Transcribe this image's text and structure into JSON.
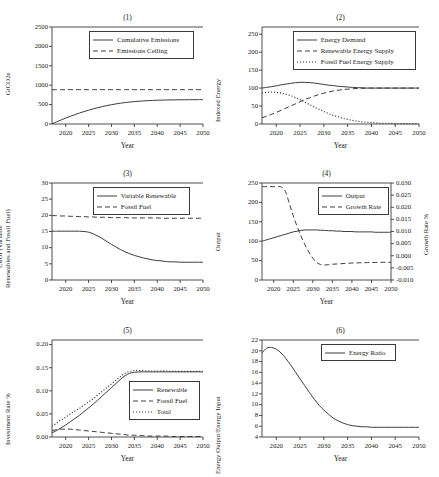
{
  "figure": {
    "background": "#ffffff",
    "line_color": "#333333",
    "axis_color": "#3a3a3a",
    "xlabel": "Year",
    "xticks": [
      "2020",
      "2025",
      "2030",
      "2035",
      "2040",
      "2045",
      "2050"
    ]
  },
  "chart_data": [
    {
      "id": "panel-1",
      "type": "line",
      "title": "(1)",
      "xlabel": "Year",
      "ylabel": "GtCO2e",
      "xlim": [
        2017,
        2050
      ],
      "ylim": [
        0,
        2500
      ],
      "yticks": [
        0,
        500,
        1000,
        1500,
        2000,
        2500
      ],
      "xticks": [
        2020,
        2025,
        2030,
        2035,
        2040,
        2045,
        2050
      ],
      "grid": false,
      "legend_position": "upper center",
      "x": [
        2017,
        2018,
        2019,
        2020,
        2021,
        2022,
        2023,
        2024,
        2025,
        2026,
        2027,
        2028,
        2029,
        2030,
        2031,
        2032,
        2033,
        2034,
        2035,
        2036,
        2037,
        2038,
        2039,
        2040,
        2041,
        2042,
        2043,
        2044,
        2045,
        2046,
        2047,
        2048,
        2049,
        2050
      ],
      "series": [
        {
          "name": "Cumulative Emissions",
          "style": "solid",
          "values": [
            5,
            55,
            105,
            153,
            198,
            241,
            282,
            320,
            356,
            390,
            421,
            449,
            475,
            498,
            519,
            537,
            552,
            566,
            577,
            587,
            595,
            602,
            608,
            612,
            616,
            619,
            621,
            623,
            624,
            625,
            626,
            627,
            627,
            628
          ]
        },
        {
          "name": "Emissions Ceiling",
          "style": "dashed",
          "values": [
            885,
            885,
            885,
            885,
            885,
            885,
            885,
            885,
            885,
            885,
            885,
            885,
            885,
            885,
            885,
            885,
            885,
            885,
            885,
            885,
            885,
            885,
            885,
            885,
            885,
            885,
            885,
            885,
            885,
            885,
            885,
            885,
            885,
            885
          ]
        }
      ]
    },
    {
      "id": "panel-2",
      "type": "line",
      "title": "(2)",
      "xlabel": "Year",
      "ylabel": "Indexed Energy",
      "xlim": [
        2017,
        2050
      ],
      "ylim": [
        0,
        270
      ],
      "yticks": [
        0,
        50,
        100,
        150,
        200,
        250
      ],
      "xticks": [
        2020,
        2025,
        2030,
        2035,
        2040,
        2045,
        2050
      ],
      "grid": false,
      "legend_position": "upper center",
      "x": [
        2017,
        2018,
        2019,
        2020,
        2021,
        2022,
        2023,
        2024,
        2025,
        2026,
        2027,
        2028,
        2029,
        2030,
        2031,
        2032,
        2033,
        2034,
        2035,
        2036,
        2037,
        2038,
        2039,
        2040,
        2041,
        2042,
        2043,
        2044,
        2045,
        2046,
        2047,
        2048,
        2049,
        2050
      ],
      "series": [
        {
          "name": "Energy Demand",
          "style": "solid",
          "values": [
            100,
            102,
            104,
            106,
            109,
            111,
            113,
            115,
            116,
            116,
            115,
            114,
            112,
            110,
            108,
            107,
            105,
            104,
            103,
            102,
            101,
            101,
            100,
            100,
            100,
            100,
            100,
            100,
            100,
            100,
            100,
            100,
            100,
            100
          ]
        },
        {
          "name": "Renewable Energy Supply",
          "style": "dashed",
          "values": [
            17,
            22,
            27,
            32,
            38,
            44,
            50,
            56,
            62,
            68,
            73,
            78,
            82,
            86,
            89,
            92,
            94,
            96,
            97,
            98,
            99,
            99,
            100,
            100,
            100,
            100,
            100,
            100,
            100,
            100,
            100,
            100,
            100,
            100
          ]
        },
        {
          "name": "Fossil Fuel Energy Supply",
          "style": "dotted",
          "values": [
            86,
            88,
            89,
            88,
            86,
            83,
            79,
            74,
            68,
            61,
            54,
            47,
            41,
            35,
            29,
            24,
            20,
            16,
            13,
            10,
            8,
            6,
            5,
            4,
            3,
            2,
            2,
            2,
            1,
            1,
            1,
            1,
            1,
            1
          ]
        }
      ]
    },
    {
      "id": "panel-3",
      "type": "line",
      "title": "(3)",
      "xlabel": "Year",
      "ylabel": "EROI (Variable Renewables and Fossil Fuel)",
      "ylabel_lines": [
        "EROI (Variable",
        "Renewables and Fossil Fuel)"
      ],
      "xlim": [
        2017,
        2050
      ],
      "ylim": [
        0,
        30
      ],
      "yticks": [
        0,
        5,
        10,
        15,
        20,
        25,
        30
      ],
      "xticks": [
        2020,
        2025,
        2030,
        2035,
        2040,
        2045,
        2050
      ],
      "grid": false,
      "legend_position": "upper center",
      "x": [
        2017,
        2018,
        2019,
        2020,
        2021,
        2022,
        2023,
        2024,
        2025,
        2026,
        2027,
        2028,
        2029,
        2030,
        2031,
        2032,
        2033,
        2034,
        2035,
        2036,
        2037,
        2038,
        2039,
        2040,
        2041,
        2042,
        2043,
        2044,
        2045,
        2046,
        2047,
        2048,
        2049,
        2050
      ],
      "series": [
        {
          "name": "Variable Renewable",
          "style": "solid",
          "values": [
            15.1,
            15.1,
            15.1,
            15.1,
            15.1,
            15.1,
            15.1,
            15.0,
            14.8,
            14.3,
            13.6,
            12.8,
            11.9,
            11.0,
            10.2,
            9.4,
            8.7,
            8.1,
            7.6,
            7.2,
            6.8,
            6.5,
            6.2,
            6.0,
            5.9,
            5.7,
            5.6,
            5.6,
            5.5,
            5.5,
            5.5,
            5.5,
            5.5,
            5.5
          ]
        },
        {
          "name": "Fossil Fuel",
          "style": "dashed",
          "values": [
            19.9,
            19.9,
            19.8,
            19.8,
            19.7,
            19.7,
            19.6,
            19.6,
            19.5,
            19.5,
            19.4,
            19.4,
            19.4,
            19.3,
            19.3,
            19.3,
            19.3,
            19.2,
            19.2,
            19.2,
            19.2,
            19.2,
            19.2,
            19.2,
            19.1,
            19.1,
            19.1,
            19.1,
            19.1,
            19.1,
            19.1,
            19.1,
            19.1,
            19.1
          ]
        }
      ]
    },
    {
      "id": "panel-4",
      "type": "line",
      "title": "(4)",
      "xlabel": "Year",
      "ylabel": "Output",
      "ylabel_right": "Growth Rate %",
      "xlim": [
        2017,
        2050
      ],
      "ylim": [
        0,
        250
      ],
      "yticks": [
        0,
        50,
        100,
        150,
        200,
        250
      ],
      "ylim_right": [
        -0.01,
        0.03
      ],
      "yticks_right": [
        "0.030",
        "0.025",
        "0.020",
        "0.015",
        "0.010",
        "0.005",
        "0.000",
        "-0.005",
        "-0.010"
      ],
      "xticks": [
        2020,
        2025,
        2030,
        2035,
        2040,
        2045,
        2050
      ],
      "grid": false,
      "legend_position": "upper center",
      "x": [
        2017,
        2018,
        2019,
        2020,
        2021,
        2022,
        2023,
        2024,
        2025,
        2026,
        2027,
        2028,
        2029,
        2030,
        2031,
        2032,
        2033,
        2034,
        2035,
        2036,
        2037,
        2038,
        2039,
        2040,
        2041,
        2042,
        2043,
        2044,
        2045,
        2046,
        2047,
        2048,
        2049,
        2050
      ],
      "series": [
        {
          "name": "Output",
          "style": "solid",
          "axis": "left",
          "values": [
            100,
            103,
            106,
            109,
            112,
            115,
            118,
            121,
            124,
            126,
            128,
            129,
            129,
            129,
            129,
            128,
            128,
            127,
            127,
            126,
            126,
            125,
            125,
            125,
            124,
            124,
            124,
            124,
            124,
            123,
            123,
            123,
            123,
            123
          ]
        },
        {
          "name": "Growth Rate",
          "style": "dashed",
          "axis": "right",
          "values": [
            0.0285,
            0.0285,
            0.0285,
            0.0285,
            0.0285,
            0.0283,
            0.0265,
            0.0215,
            0.0165,
            0.012,
            0.008,
            0.0045,
            0.0015,
            -0.001,
            -0.0028,
            -0.0036,
            -0.0038,
            -0.0037,
            -0.0035,
            -0.0034,
            -0.0033,
            -0.0032,
            -0.0031,
            -0.003,
            -0.003,
            -0.0029,
            -0.0029,
            -0.0028,
            -0.0028,
            -0.0028,
            -0.0027,
            -0.0027,
            -0.0027,
            -0.0027
          ]
        }
      ]
    },
    {
      "id": "panel-5",
      "type": "line",
      "title": "(5)",
      "xlabel": "Year",
      "ylabel": "Investment Rate %",
      "xlim": [
        2017,
        2050
      ],
      "ylim": [
        0.0,
        0.21
      ],
      "yticks": [
        "0.00",
        "0.05",
        "0.10",
        "0.15",
        "0.20"
      ],
      "xticks": [
        2020,
        2025,
        2030,
        2035,
        2040,
        2045,
        2050
      ],
      "grid": false,
      "legend_position": "lower right",
      "x": [
        2017,
        2018,
        2019,
        2020,
        2021,
        2022,
        2023,
        2024,
        2025,
        2026,
        2027,
        2028,
        2029,
        2030,
        2031,
        2032,
        2033,
        2034,
        2035,
        2036,
        2037,
        2038,
        2039,
        2040,
        2041,
        2042,
        2043,
        2044,
        2045,
        2046,
        2047,
        2048,
        2049,
        2050
      ],
      "series": [
        {
          "name": "Renewable",
          "style": "solid",
          "values": [
            0.009,
            0.014,
            0.02,
            0.026,
            0.033,
            0.04,
            0.047,
            0.055,
            0.063,
            0.071,
            0.08,
            0.089,
            0.098,
            0.107,
            0.116,
            0.125,
            0.133,
            0.138,
            0.14,
            0.141,
            0.141,
            0.141,
            0.141,
            0.141,
            0.141,
            0.141,
            0.141,
            0.141,
            0.141,
            0.141,
            0.141,
            0.141,
            0.141,
            0.141
          ]
        },
        {
          "name": "Fossil Fuel",
          "style": "dashed",
          "values": [
            0.014,
            0.016,
            0.017,
            0.017,
            0.017,
            0.016,
            0.015,
            0.014,
            0.013,
            0.012,
            0.011,
            0.01,
            0.009,
            0.008,
            0.007,
            0.006,
            0.005,
            0.004,
            0.004,
            0.003,
            0.003,
            0.002,
            0.002,
            0.002,
            0.002,
            0.002,
            0.001,
            0.001,
            0.001,
            0.001,
            0.001,
            0.001,
            0.001,
            0.001
          ]
        },
        {
          "name": "Total",
          "style": "dotted",
          "values": [
            0.023,
            0.03,
            0.037,
            0.043,
            0.05,
            0.056,
            0.062,
            0.069,
            0.076,
            0.083,
            0.091,
            0.099,
            0.107,
            0.115,
            0.123,
            0.131,
            0.138,
            0.142,
            0.144,
            0.144,
            0.144,
            0.143,
            0.143,
            0.143,
            0.143,
            0.143,
            0.142,
            0.142,
            0.142,
            0.142,
            0.142,
            0.142,
            0.142,
            0.142
          ]
        }
      ]
    },
    {
      "id": "panel-6",
      "type": "line",
      "title": "(6)",
      "xlabel": "Year",
      "ylabel": "Energy Output/Energy Input",
      "xlim": [
        2017,
        2050
      ],
      "ylim": [
        4,
        22
      ],
      "yticks": [
        4,
        6,
        8,
        10,
        12,
        14,
        16,
        18,
        20,
        22
      ],
      "xticks": [
        2020,
        2025,
        2030,
        2035,
        2040,
        2045,
        2050
      ],
      "grid": false,
      "legend_position": "upper center",
      "x": [
        2017,
        2018,
        2019,
        2020,
        2021,
        2022,
        2023,
        2024,
        2025,
        2026,
        2027,
        2028,
        2029,
        2030,
        2031,
        2032,
        2033,
        2034,
        2035,
        2036,
        2037,
        2038,
        2039,
        2040,
        2041,
        2042,
        2043,
        2044,
        2045,
        2046,
        2047,
        2048,
        2049,
        2050
      ],
      "series": [
        {
          "name": "Energy Ratio",
          "style": "solid",
          "values": [
            19.6,
            20.5,
            20.6,
            20.3,
            19.6,
            18.6,
            17.4,
            16.1,
            14.8,
            13.5,
            12.2,
            11.0,
            9.9,
            9.0,
            8.2,
            7.5,
            7.0,
            6.6,
            6.3,
            6.1,
            6.0,
            5.9,
            5.9,
            5.8,
            5.8,
            5.8,
            5.8,
            5.8,
            5.8,
            5.8,
            5.8,
            5.8,
            5.8,
            5.8
          ]
        }
      ]
    }
  ]
}
